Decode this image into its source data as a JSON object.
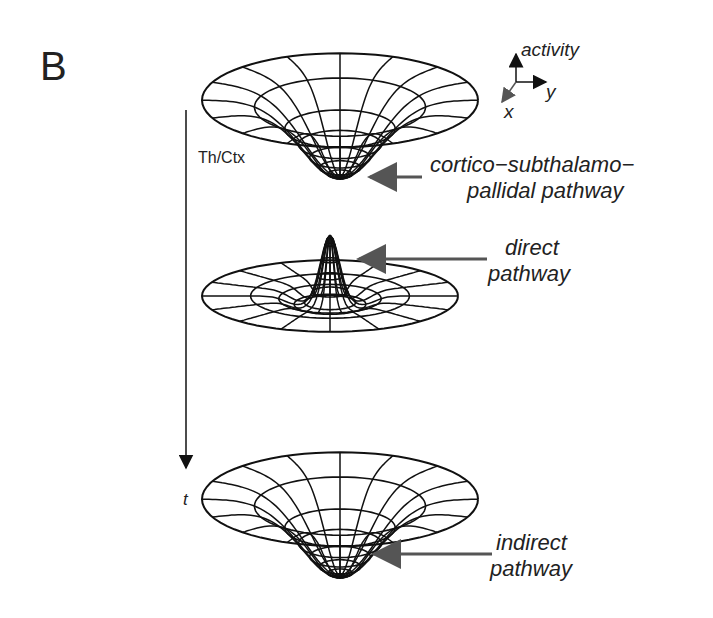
{
  "panel_label": "B",
  "axes": {
    "z_label": "activity",
    "y_label": "y",
    "x_label": "x"
  },
  "time_axis": {
    "top_label": "Th/Ctx",
    "bottom_label": "t"
  },
  "surfaces": [
    {
      "name": "funnel-top",
      "shape": "depression",
      "annotation_line1": "cortico−subthalamo−",
      "annotation_line2": "pallidal pathway"
    },
    {
      "name": "peak-middle",
      "shape": "peak",
      "annotation_line1": "direct",
      "annotation_line2": "pathway"
    },
    {
      "name": "funnel-bottom",
      "shape": "depression",
      "annotation_line1": "indirect",
      "annotation_line2": "pathway"
    }
  ],
  "colors": {
    "line": "#111111",
    "arrow": "#555555"
  }
}
